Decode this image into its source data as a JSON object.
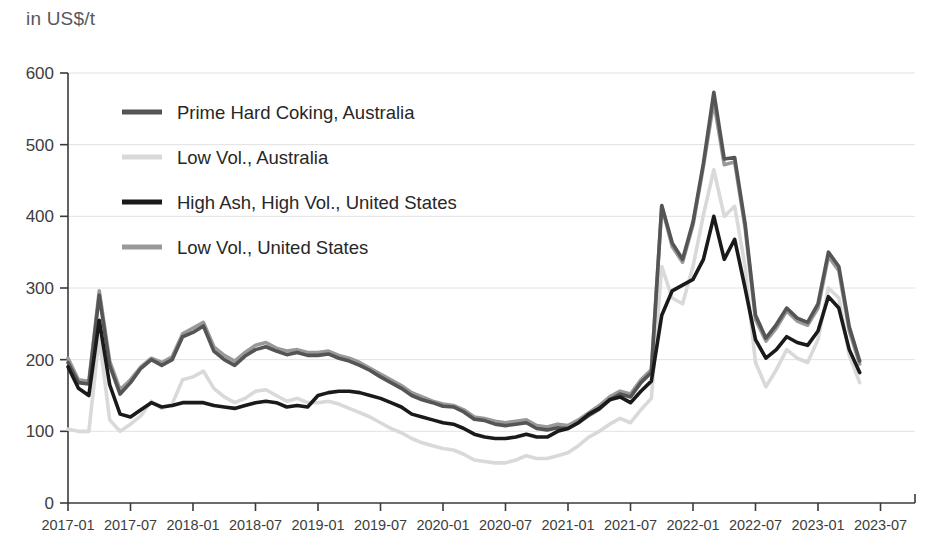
{
  "header": {
    "unit_label": "in US$/t"
  },
  "chart_data": {
    "type": "line",
    "title": "",
    "subtitle": "",
    "xlabel": "",
    "ylabel": "in US$/t",
    "ylim": [
      0,
      600
    ],
    "yticks": [
      0,
      100,
      200,
      300,
      400,
      500,
      600
    ],
    "ytick_labels": [
      "0",
      "100",
      "200",
      "300",
      "400",
      "500",
      "600"
    ],
    "grid": true,
    "legend_position": "upper-left-inside",
    "xtick_labels": [
      "2017-01",
      "2017-07",
      "2018-01",
      "2018-07",
      "2019-01",
      "2019-07",
      "2020-01",
      "2020-07",
      "2021-01",
      "2021-07",
      "2022-01",
      "2022-07",
      "2023-01",
      "2023-07"
    ],
    "x_start": "2017-01",
    "x_end": "2023-07",
    "x_step_months": 6,
    "x": [
      "2017-01",
      "2017-02",
      "2017-03",
      "2017-04",
      "2017-05",
      "2017-06",
      "2017-07",
      "2017-08",
      "2017-09",
      "2017-10",
      "2017-11",
      "2017-12",
      "2018-01",
      "2018-02",
      "2018-03",
      "2018-04",
      "2018-05",
      "2018-06",
      "2018-07",
      "2018-08",
      "2018-09",
      "2018-10",
      "2018-11",
      "2018-12",
      "2019-01",
      "2019-02",
      "2019-03",
      "2019-04",
      "2019-05",
      "2019-06",
      "2019-07",
      "2019-08",
      "2019-09",
      "2019-10",
      "2019-11",
      "2019-12",
      "2020-01",
      "2020-02",
      "2020-03",
      "2020-04",
      "2020-05",
      "2020-06",
      "2020-07",
      "2020-08",
      "2020-09",
      "2020-10",
      "2020-11",
      "2020-12",
      "2021-01",
      "2021-02",
      "2021-03",
      "2021-04",
      "2021-05",
      "2021-06",
      "2021-07",
      "2021-08",
      "2021-09",
      "2021-10",
      "2021-11",
      "2021-12",
      "2022-01",
      "2022-02",
      "2022-03",
      "2022-04",
      "2022-05",
      "2022-06",
      "2022-07",
      "2022-08",
      "2022-09",
      "2022-10",
      "2022-11",
      "2022-12",
      "2023-01",
      "2023-02",
      "2023-03",
      "2023-04",
      "2023-05"
    ],
    "series": [
      {
        "name": "Prime Hard Coking, Australia",
        "color": "#555555",
        "width": 3.6,
        "values": [
          196,
          168,
          166,
          290,
          192,
          152,
          168,
          188,
          200,
          192,
          200,
          232,
          238,
          247,
          212,
          200,
          192,
          205,
          214,
          218,
          212,
          207,
          210,
          206,
          206,
          208,
          202,
          198,
          192,
          185,
          176,
          168,
          160,
          150,
          144,
          140,
          135,
          134,
          127,
          117,
          115,
          110,
          108,
          110,
          112,
          104,
          102,
          105,
          104,
          112,
          122,
          131,
          144,
          152,
          148,
          168,
          182,
          415,
          363,
          340,
          392,
          474,
          573,
          480,
          482,
          390,
          262,
          230,
          249,
          272,
          258,
          252,
          278,
          350,
          330,
          246,
          198
        ]
      },
      {
        "name": "Low Vol., Australia",
        "color": "#d9d9d9",
        "width": 3.6,
        "values": [
          103,
          100,
          100,
          232,
          116,
          100,
          110,
          122,
          142,
          132,
          138,
          172,
          176,
          184,
          160,
          148,
          140,
          146,
          156,
          158,
          150,
          142,
          146,
          140,
          140,
          142,
          138,
          132,
          126,
          120,
          112,
          104,
          98,
          90,
          84,
          80,
          76,
          74,
          68,
          60,
          58,
          56,
          56,
          60,
          66,
          62,
          62,
          66,
          70,
          80,
          92,
          100,
          110,
          118,
          112,
          130,
          146,
          330,
          286,
          278,
          330,
          402,
          465,
          400,
          414,
          330,
          196,
          162,
          186,
          214,
          202,
          196,
          228,
          300,
          286,
          206,
          168
        ]
      },
      {
        "name": "High Ash, High Vol., United States",
        "color": "#1a1a1a",
        "width": 3.6,
        "values": [
          190,
          160,
          150,
          255,
          165,
          124,
          120,
          130,
          140,
          134,
          136,
          140,
          140,
          140,
          136,
          134,
          132,
          136,
          140,
          142,
          140,
          134,
          136,
          134,
          150,
          154,
          156,
          156,
          154,
          150,
          146,
          140,
          134,
          124,
          120,
          116,
          112,
          110,
          104,
          96,
          92,
          90,
          90,
          92,
          96,
          92,
          92,
          100,
          104,
          112,
          124,
          132,
          144,
          148,
          140,
          156,
          170,
          262,
          296,
          304,
          312,
          340,
          400,
          340,
          368,
          300,
          228,
          202,
          214,
          232,
          224,
          220,
          240,
          288,
          272,
          214,
          182
        ]
      },
      {
        "name": "Low Vol., United States",
        "color": "#999999",
        "width": 3.6,
        "values": [
          202,
          172,
          170,
          296,
          198,
          158,
          172,
          190,
          202,
          196,
          204,
          236,
          244,
          252,
          218,
          206,
          198,
          210,
          220,
          224,
          216,
          212,
          214,
          210,
          210,
          212,
          206,
          202,
          196,
          188,
          180,
          172,
          164,
          154,
          148,
          142,
          138,
          136,
          130,
          120,
          118,
          114,
          112,
          114,
          116,
          108,
          106,
          110,
          108,
          116,
          126,
          136,
          148,
          156,
          152,
          172,
          186,
          414,
          358,
          336,
          388,
          470,
          560,
          472,
          476,
          384,
          256,
          226,
          244,
          268,
          254,
          248,
          272,
          344,
          324,
          240,
          194
        ]
      }
    ],
    "legend": [
      {
        "label": "Prime Hard Coking, Australia",
        "color": "#555555"
      },
      {
        "label": "Low Vol., Australia",
        "color": "#d9d9d9"
      },
      {
        "label": "High Ash, High Vol., United States",
        "color": "#1a1a1a"
      },
      {
        "label": "Low Vol., United States",
        "color": "#999999"
      }
    ]
  }
}
